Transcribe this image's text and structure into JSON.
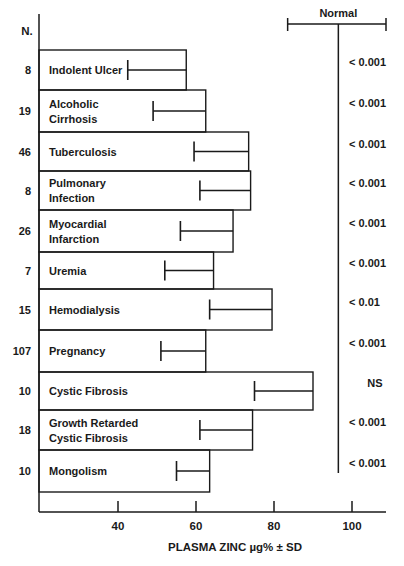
{
  "chart_data": {
    "type": "bar",
    "orientation": "horizontal",
    "title": "",
    "xlabel": "PLASMA ZINC µg% ± SD",
    "ylabel": "",
    "n_header": "N.",
    "xlim": [
      20,
      108
    ],
    "xticks": [
      40,
      60,
      80,
      100
    ],
    "grid": false,
    "legend": null,
    "categories": [
      "Indolent Ulcer",
      "Alcoholic Cirrhosis",
      "Tuberculosis",
      "Pulmonary Infection",
      "Myocardial Infarction",
      "Uremia",
      "Hemodialysis",
      "Pregnancy",
      "Cystic Fibrosis",
      "Growth Retarded Cystic Fibrosis",
      "Mongolism"
    ],
    "label_lines": [
      [
        "Indolent Ulcer"
      ],
      [
        "Alcoholic",
        "Cirrhosis"
      ],
      [
        "Tuberculosis"
      ],
      [
        "Pulmonary",
        "Infection"
      ],
      [
        "Myocardial",
        "Infarction"
      ],
      [
        "Uremia"
      ],
      [
        "Hemodialysis"
      ],
      [
        "Pregnancy"
      ],
      [
        "Cystic Fibrosis"
      ],
      [
        "Growth Retarded",
        "Cystic Fibrosis"
      ],
      [
        "Mongolism"
      ]
    ],
    "n": [
      "8",
      "19",
      "46",
      "8",
      "26",
      "7",
      "15",
      "107",
      "10",
      "18",
      "10"
    ],
    "values": [
      57.5,
      62.5,
      73.5,
      74,
      69.5,
      64.5,
      79.5,
      62.5,
      90,
      74.5,
      63.5
    ],
    "sd": [
      15,
      13.5,
      14,
      13,
      13.5,
      12.5,
      16,
      11.5,
      15,
      13.5,
      8.5
    ],
    "p_values": [
      "< 0.001",
      "< 0.001",
      "< 0.001",
      "< 0.001",
      "< 0.001",
      "< 0.001",
      "< 0.01",
      "< 0.001",
      "NS",
      "< 0.001",
      "< 0.001"
    ],
    "normal": {
      "label": "Normal",
      "mean": 96.5,
      "low": 83.5,
      "high": 108
    }
  },
  "colors": {
    "ink": "#1a1a1a",
    "background": "#ffffff"
  }
}
